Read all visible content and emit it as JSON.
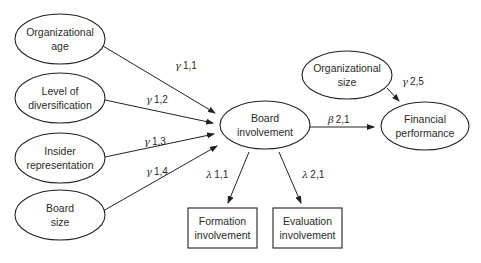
{
  "diagram": {
    "type": "structural-equation-model",
    "nodes": {
      "org_age": {
        "lines": [
          "Organizational",
          "age"
        ],
        "shape": "ellipse"
      },
      "diversification": {
        "lines": [
          "Level of",
          "diversification"
        ],
        "shape": "ellipse"
      },
      "insider": {
        "lines": [
          "Insider",
          "representation"
        ],
        "shape": "ellipse"
      },
      "board_size": {
        "lines": [
          "Board",
          "size"
        ],
        "shape": "ellipse"
      },
      "board_involvement": {
        "lines": [
          "Board",
          "involvement"
        ],
        "shape": "ellipse"
      },
      "org_size": {
        "lines": [
          "Organizational",
          "size"
        ],
        "shape": "ellipse"
      },
      "financial": {
        "lines": [
          "Financial",
          "performance"
        ],
        "shape": "ellipse"
      },
      "formation": {
        "lines": [
          "Formation",
          "involvement"
        ],
        "shape": "rectangle"
      },
      "evaluation": {
        "lines": [
          "Evaluation",
          "involvement"
        ],
        "shape": "rectangle"
      }
    },
    "edges": {
      "g11": {
        "from": "org_age",
        "to": "board_involvement",
        "symbol": "γ",
        "index": "1,1"
      },
      "g12": {
        "from": "diversification",
        "to": "board_involvement",
        "symbol": "γ",
        "index": "1,2"
      },
      "g13": {
        "from": "insider",
        "to": "board_involvement",
        "symbol": "γ",
        "index": "1,3"
      },
      "g14": {
        "from": "board_size",
        "to": "board_involvement",
        "symbol": "γ",
        "index": "1,4"
      },
      "b21": {
        "from": "board_involvement",
        "to": "financial",
        "symbol": "β",
        "index": "2,1"
      },
      "g25": {
        "from": "org_size",
        "to": "financial",
        "symbol": "γ",
        "index": "2,5"
      },
      "l11": {
        "from": "board_involvement",
        "to": "formation",
        "symbol": "λ",
        "index": "1,1"
      },
      "l21": {
        "from": "board_involvement",
        "to": "evaluation",
        "symbol": "λ",
        "index": "2,1"
      }
    }
  }
}
